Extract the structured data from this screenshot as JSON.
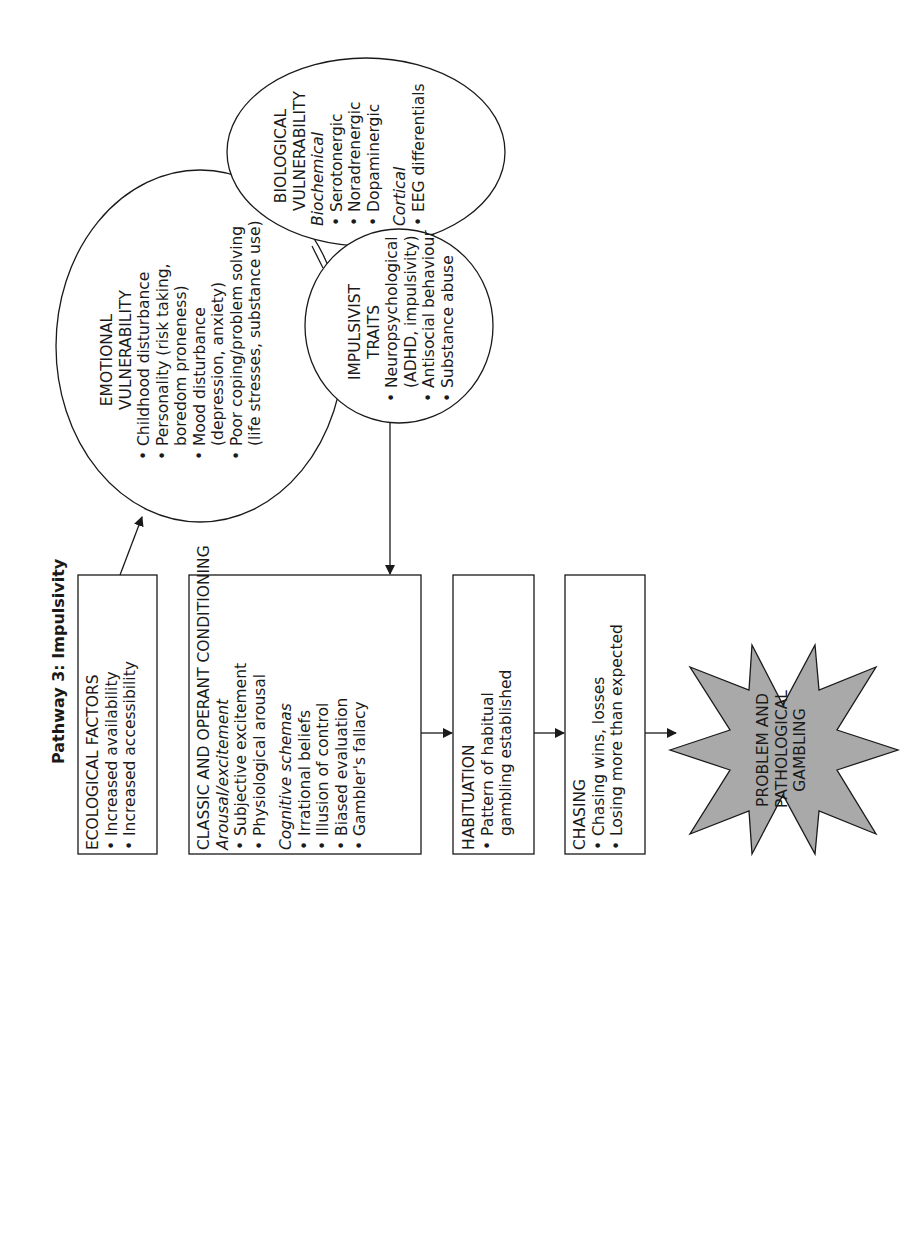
{
  "title": "Pathway 3: Impulsivity",
  "colors": {
    "line": "#1a1a1a",
    "star_fill": "#a9a9a9",
    "background": "#ffffff"
  },
  "ecological": {
    "heading": "ECOLOGICAL FACTORS",
    "items": [
      "Increased availability",
      "Increased accessibility"
    ]
  },
  "conditioning": {
    "heading": "CLASSIC AND OPERANT CONDITIONING",
    "arousal_label": "Arousal/excitement",
    "arousal_items": [
      "Subjective excitement",
      "Physiological arousal"
    ],
    "cognitive_label": "Cognitive schemas",
    "cognitive_items": [
      "Irrational beliefs",
      "Illusion of control",
      "Biased evaluation",
      "Gambler's fallacy"
    ]
  },
  "habituation": {
    "heading": "HABITUATION",
    "items": [
      "Pattern of habitual gambling established"
    ]
  },
  "chasing": {
    "heading": "CHASING",
    "items": [
      "Chasing wins, losses",
      "Losing more than expected"
    ]
  },
  "outcome": {
    "line1": "PROBLEM AND",
    "line2": "PATHOLOGICAL",
    "line3": "GAMBLING"
  },
  "emotional": {
    "heading1": "EMOTIONAL",
    "heading2": "VULNERABILITY",
    "items": [
      {
        "a": "Childhood disturbance",
        "b": ""
      },
      {
        "a": "Personality (risk taking,",
        "b": "boredom proneness)"
      },
      {
        "a": "Mood disturbance",
        "b": "(depression, anxiety)"
      },
      {
        "a": "Poor coping/problem solving",
        "b": "(life stresses, substance use)"
      }
    ]
  },
  "biological": {
    "heading1": "BIOLOGICAL",
    "heading2": "VULNERABILITY",
    "biochemical_label": "Biochemical",
    "biochemical_items": [
      "Serotonergic",
      "Noradrenergic",
      "Dopaminergic"
    ],
    "cortical_label": "Cortical",
    "cortical_items": [
      "EEG differentials"
    ]
  },
  "impulsivist": {
    "heading1": "IMPULSIVIST",
    "heading2": "TRAITS",
    "items": [
      {
        "a": "Neuropsychological",
        "b": "(ADHD, impulsivity)"
      },
      {
        "a": "Antisocial behaviour",
        "b": ""
      },
      {
        "a": "Substance abuse",
        "b": ""
      }
    ]
  }
}
